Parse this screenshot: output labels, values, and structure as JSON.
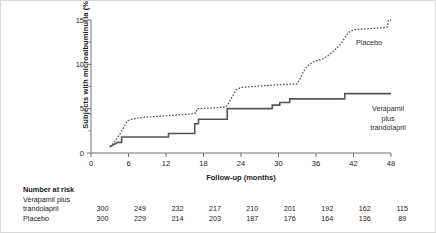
{
  "chart_data": {
    "type": "line",
    "title": "",
    "xlabel": "Follow-up (months)",
    "ylabel": "Subjects with microalbuminuria (%)",
    "xlim": [
      0,
      48
    ],
    "ylim": [
      0,
      15
    ],
    "xticks": [
      0,
      6,
      12,
      18,
      24,
      30,
      36,
      42,
      48
    ],
    "yticks": [
      0,
      5,
      10,
      15
    ],
    "yminorticks": [
      2.5,
      7.5,
      12.5
    ],
    "grid": false,
    "legend_position": "inline-annotation",
    "series": [
      {
        "name": "Placebo",
        "style": "dotted",
        "color": "#555555",
        "annotation": "Placebo",
        "points": [
          [
            3.0,
            0.7
          ],
          [
            3.6,
            1.1
          ],
          [
            4.1,
            1.6
          ],
          [
            4.6,
            2.1
          ],
          [
            5.0,
            2.6
          ],
          [
            5.4,
            3.1
          ],
          [
            5.8,
            3.6
          ],
          [
            6.4,
            3.8
          ],
          [
            8.0,
            4.0
          ],
          [
            10.0,
            4.1
          ],
          [
            12.0,
            4.2
          ],
          [
            14.0,
            4.3
          ],
          [
            16.0,
            4.4
          ],
          [
            16.8,
            4.5
          ],
          [
            17.0,
            5.0
          ],
          [
            20.0,
            5.1
          ],
          [
            21.6,
            5.2
          ],
          [
            22.0,
            5.6
          ],
          [
            22.4,
            6.1
          ],
          [
            22.8,
            6.6
          ],
          [
            23.2,
            7.1
          ],
          [
            24.0,
            7.4
          ],
          [
            26.0,
            7.5
          ],
          [
            28.0,
            7.6
          ],
          [
            30.0,
            7.7
          ],
          [
            33.0,
            7.8
          ],
          [
            33.4,
            8.3
          ],
          [
            34.0,
            9.2
          ],
          [
            34.6,
            9.8
          ],
          [
            35.4,
            10.2
          ],
          [
            36.0,
            10.4
          ],
          [
            37.0,
            10.6
          ],
          [
            38.0,
            11.0
          ],
          [
            39.0,
            11.6
          ],
          [
            40.0,
            12.3
          ],
          [
            40.6,
            13.0
          ],
          [
            41.2,
            13.6
          ],
          [
            42.0,
            13.9
          ],
          [
            44.0,
            14.0
          ],
          [
            46.0,
            14.1
          ],
          [
            47.4,
            14.2
          ],
          [
            47.6,
            15.0
          ],
          [
            48.0,
            15.0
          ]
        ]
      },
      {
        "name": "Verapamil plus trandolapril",
        "style": "solid",
        "color": "#555555",
        "annotation": "Verapamil\nplus\ntrandolapril",
        "points": [
          [
            3.0,
            0.7
          ],
          [
            4.3,
            1.2
          ],
          [
            4.9,
            1.2
          ],
          [
            4.9,
            1.8
          ],
          [
            12.4,
            1.8
          ],
          [
            12.4,
            2.2
          ],
          [
            16.6,
            2.2
          ],
          [
            16.6,
            3.3
          ],
          [
            17.2,
            3.3
          ],
          [
            17.2,
            3.8
          ],
          [
            21.8,
            3.8
          ],
          [
            21.8,
            5.0
          ],
          [
            29.0,
            5.0
          ],
          [
            29.0,
            5.4
          ],
          [
            30.2,
            5.4
          ],
          [
            30.2,
            5.7
          ],
          [
            31.8,
            5.7
          ],
          [
            31.8,
            6.1
          ],
          [
            40.6,
            6.1
          ],
          [
            40.6,
            6.7
          ],
          [
            48.0,
            6.7
          ]
        ]
      }
    ]
  },
  "risk_table": {
    "title": "Number at risk",
    "timepoints": [
      0,
      6,
      12,
      18,
      24,
      30,
      36,
      42,
      48
    ],
    "rows": [
      {
        "label_line1": "Verapamil plus",
        "label_line2": "trandolapril",
        "values": [
          "300",
          "249",
          "232",
          "217",
          "210",
          "201",
          "192",
          "162",
          "115"
        ]
      },
      {
        "label_line1": "",
        "label_line2": "Placebo",
        "values": [
          "300",
          "229",
          "214",
          "203",
          "187",
          "176",
          "164",
          "136",
          "89"
        ]
      }
    ]
  },
  "annotations": {
    "placebo": "Placebo",
    "verapamil_line1": "Verapamil",
    "verapamil_line2": "plus",
    "verapamil_line3": "trandolapril"
  },
  "colors": {
    "line": "#555555",
    "axis": "#6e6e6e",
    "text": "#1a1a1a",
    "frame": "#d8d8d8"
  }
}
